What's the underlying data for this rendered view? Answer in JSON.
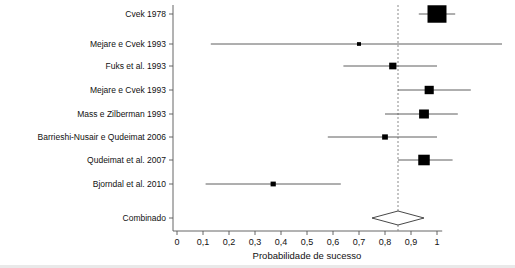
{
  "figure": {
    "title": "",
    "axis_title": "Probabilidade de sucesso",
    "combined_label": "Combinado"
  },
  "chart_data": {
    "type": "scatter",
    "subtype": "forest-plot",
    "title": "",
    "xlabel": "Probabilidade de sucesso",
    "ylabel": "",
    "xlim": [
      0,
      1.05
    ],
    "xticks": [
      0,
      0.1,
      0.2,
      0.3,
      0.4,
      0.5,
      0.6,
      0.7,
      0.8,
      0.9,
      1
    ],
    "xticklabels": [
      "0",
      "0,1",
      "0,2",
      "0,3",
      "0,4",
      "0,5",
      "0,6",
      "0,7",
      "0,8",
      "0,9",
      "1"
    ],
    "grid": false,
    "legend": null,
    "reference_line": {
      "value": 0.85,
      "style": "dashed",
      "color": "#8a8a8a"
    },
    "marker_color": "#000000",
    "ci_line_color": "#4d4d4d",
    "categories": [
      "Cvek 1978",
      "Mejare e Cvek 1993",
      "Fuks et al. 1993",
      "Mejare e Cvek 1993",
      "Mass e Zilberman 1993",
      "Barrieshi-Nusair e Qudeimat 2006",
      "Qudeimat et al. 2007",
      "Bjorndal et al. 2010"
    ],
    "studies": [
      {
        "label": "Cvek 1978",
        "estimate": 1.0,
        "ci_low": 0.93,
        "ci_high": 1.07,
        "weight": 0.94
      },
      {
        "label": "Mejare e Cvek 1993",
        "estimate": 0.7,
        "ci_low": 0.13,
        "ci_high": 1.25,
        "weight": 0.06
      },
      {
        "label": "Fuks et al. 1993",
        "estimate": 0.83,
        "ci_low": 0.64,
        "ci_high": 1.0,
        "weight": 0.25
      },
      {
        "label": "Mejare e Cvek 1993",
        "estimate": 0.97,
        "ci_low": 0.85,
        "ci_high": 1.13,
        "weight": 0.36
      },
      {
        "label": "Mass e Zilberman 1993",
        "estimate": 0.95,
        "ci_low": 0.8,
        "ci_high": 1.08,
        "weight": 0.4
      },
      {
        "label": "Barrieshi-Nusair e Qudeimat 2006",
        "estimate": 0.8,
        "ci_low": 0.58,
        "ci_high": 1.0,
        "weight": 0.16
      },
      {
        "label": "Qudeimat et al. 2007",
        "estimate": 0.95,
        "ci_low": 0.85,
        "ci_high": 1.06,
        "weight": 0.5
      },
      {
        "label": "Bjorndal et al. 2010",
        "estimate": 0.37,
        "ci_low": 0.11,
        "ci_high": 0.63,
        "weight": 0.13
      }
    ],
    "combined": {
      "label": "Combinado",
      "estimate": 0.85,
      "ci_low": 0.75,
      "ci_high": 0.95,
      "shape": "diamond",
      "fill": "#ffffff",
      "stroke": "#333333"
    }
  }
}
